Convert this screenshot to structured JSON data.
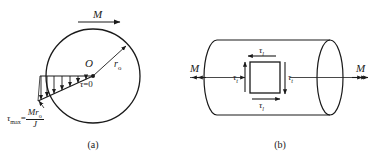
{
  "figure": {
    "background_color": "#ffffff",
    "line_color": "#1a1a1a"
  },
  "panel_a": {
    "caption": "(a)",
    "torque_label": "M",
    "center_label": "O",
    "radius_label_base": "r",
    "radius_label_sub": "o",
    "zero_stress_label_tau": "τ",
    "zero_stress_label_rest": "=0",
    "max_stress": {
      "tau": "τ",
      "tau_sub": "max",
      "equals": "=",
      "numerator_M": "M",
      "numerator_r": "r",
      "numerator_r_sub": "o",
      "denominator": "J"
    },
    "arrow_count": 7
  },
  "panel_b": {
    "caption": "(b)",
    "torque_left_label": "M",
    "torque_right_label": "M",
    "shear_top": "τ",
    "shear_top_sub": "l",
    "shear_bottom": "τ",
    "shear_bottom_sub": "l",
    "shear_left": "τ",
    "shear_left_sub": "t",
    "shear_right": "τ",
    "shear_right_sub": "t"
  }
}
